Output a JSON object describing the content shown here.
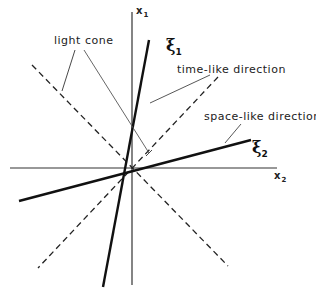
{
  "diagram": {
    "axes": {
      "vertical_label": "x",
      "vertical_subscript": "1",
      "horizontal_label": "x",
      "horizontal_subscript": "2"
    },
    "vectors": [
      {
        "symbol": "ξ",
        "subscript": "1",
        "description": "time-like direction"
      },
      {
        "symbol": "ξ",
        "subscript": "2",
        "description": "space-like direction"
      }
    ],
    "annotations": {
      "light_cone": "light cone",
      "time_like": "time-like direction",
      "space_like": "space-like direction"
    },
    "colors": {
      "line": "#111111",
      "axis": "#333333",
      "background": "#ffffff"
    }
  }
}
